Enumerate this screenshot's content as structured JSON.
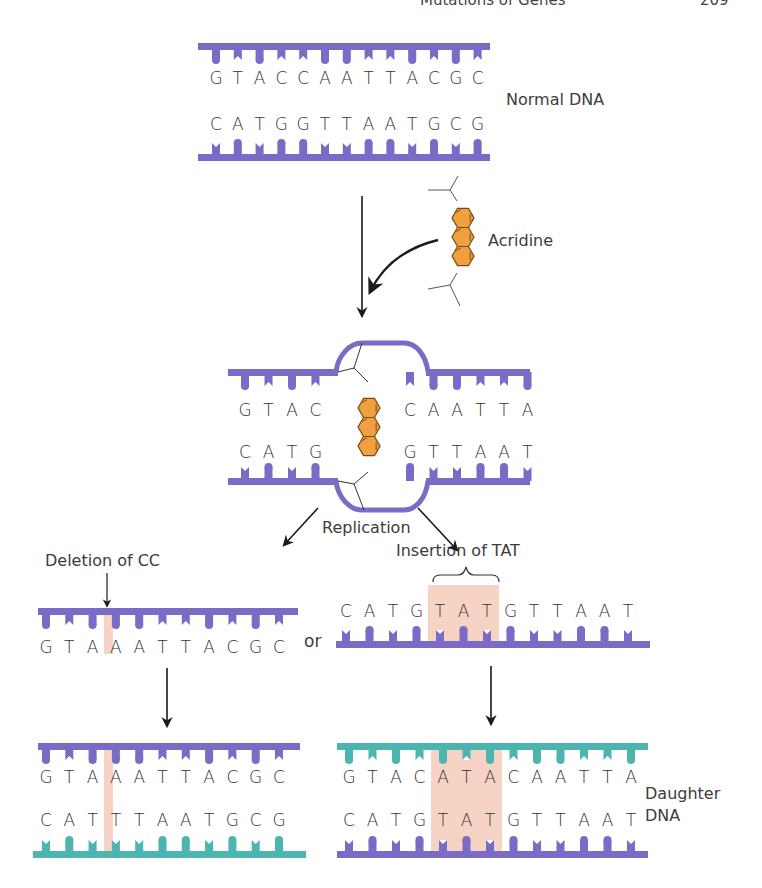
{
  "header": {
    "running_title": "Mutations of Genes",
    "page_number": "209"
  },
  "colors": {
    "parent_strand": "#7a6cc6",
    "daughter_strand": "#4cb5b0",
    "acridine_fill": "#f0a040",
    "acridine_stroke": "#7a4a10",
    "highlight": "#f6d3c4",
    "arrow": "#1a1a1a",
    "text": "#3c3c3c"
  },
  "normal_dna": {
    "label": "Normal DNA",
    "top_strand": [
      "G",
      "T",
      "A",
      "C",
      "C",
      "A",
      "A",
      "T",
      "T",
      "A",
      "C",
      "G",
      "C"
    ],
    "bottom_strand": [
      "C",
      "A",
      "T",
      "G",
      "G",
      "T",
      "T",
      "A",
      "A",
      "T",
      "G",
      "C",
      "G"
    ]
  },
  "acridine": {
    "label": "Acridine"
  },
  "intercalated": {
    "top_left": [
      "G",
      "T",
      "A",
      "C"
    ],
    "top_right": [
      "C",
      "A",
      "A",
      "T",
      "T",
      "A"
    ],
    "bottom_left": [
      "C",
      "A",
      "T",
      "G"
    ],
    "bottom_right": [
      "G",
      "T",
      "T",
      "A",
      "A",
      "T"
    ],
    "replication_label": "Replication"
  },
  "deletion": {
    "label": "Deletion of CC",
    "strand": [
      "G",
      "T",
      "A",
      "A",
      "A",
      "T",
      "T",
      "A",
      "C",
      "G",
      "C"
    ],
    "connector": "or"
  },
  "insertion": {
    "label": "Insertion of TAT",
    "strand": [
      "C",
      "A",
      "T",
      "G",
      "T",
      "A",
      "T",
      "G",
      "T",
      "T",
      "A",
      "A",
      "T"
    ],
    "highlight_range": [
      4,
      6
    ]
  },
  "daughter_left": {
    "top_strand": [
      "G",
      "T",
      "A",
      "A",
      "A",
      "T",
      "T",
      "A",
      "C",
      "G",
      "C"
    ],
    "bottom_strand": [
      "C",
      "A",
      "T",
      "T",
      "T",
      "A",
      "A",
      "T",
      "G",
      "C",
      "G"
    ]
  },
  "daughter_right": {
    "label_line1": "Daughter",
    "label_line2": "DNA",
    "top_strand": [
      "G",
      "T",
      "A",
      "C",
      "A",
      "T",
      "A",
      "C",
      "A",
      "A",
      "T",
      "T",
      "A"
    ],
    "bottom_strand": [
      "C",
      "A",
      "T",
      "G",
      "T",
      "A",
      "T",
      "G",
      "T",
      "T",
      "A",
      "A",
      "T"
    ],
    "highlight_range": [
      4,
      6
    ]
  }
}
